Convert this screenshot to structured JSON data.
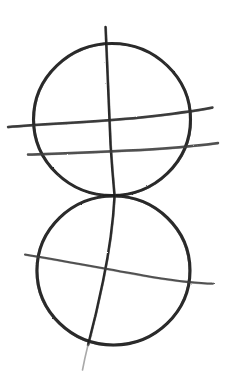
{
  "canvas": {
    "width": 234,
    "height": 383,
    "background_color": "#ffffff",
    "medium": "pencil-sketch",
    "subject": "two tangent circles with meridian and latitude guide lines"
  },
  "palette": {
    "ink": "#1c1c1c",
    "ink_soft": "#3a3a3a",
    "ink_faint": "#8c8c8c",
    "paper": "#ffffff"
  },
  "shapes": [
    {
      "name": "upper-circle",
      "kind": "circle",
      "cx": 112,
      "cy": 119.5,
      "rx": 78.5,
      "ry": 76,
      "stroke_color": "#1c1c1c",
      "stroke_width": 3.1,
      "path": "M 112 43.5 C 155 43.5 190.5 77.5 190.5 119.5 C 190.5 161.5 155 195.5 112 195.5 C 69 195.5 33.5 161.5 33.5 119.5 C 33.5 77.5 69 43.5 112 43.5 Z"
    },
    {
      "name": "lower-circle",
      "kind": "circle",
      "cx": 113.5,
      "cy": 270.5,
      "rx": 76.5,
      "ry": 74.5,
      "stroke_color": "#1c1c1c",
      "stroke_width": 3.1,
      "path": "M 113.5 196 C 155.5 196 190 229.5 190 270.5 C 190 311.5 155.5 345 113.5 345 C 71.5 345 37 311.5 37 270.5 C 37 229.5 71.5 196 113.5 196 Z"
    },
    {
      "name": "meridian-curve-upper",
      "kind": "open-curve",
      "stroke_color": "#1c1c1c",
      "stroke_width": 2.4,
      "path": "M 105.5 27 C 107.5 70 109 110 110.5 145 C 112 168 113.5 185 114.5 196"
    },
    {
      "name": "meridian-curve-lower",
      "kind": "open-curve",
      "stroke_color": "#1c1c1c",
      "stroke_width": 2.4,
      "path": "M 114.5 196 C 113 225 109 252 103 281 C 97.5 308 92 330 88 345"
    },
    {
      "name": "meridian-tail",
      "kind": "open-curve",
      "stroke_color": "#8c8c8c",
      "stroke_width": 1.6,
      "path": "M 88 345 C 86 353 84 362 82.5 370"
    },
    {
      "name": "latitude-curve-upper",
      "kind": "open-curve",
      "stroke_color": "#2a2a2a",
      "stroke_width": 2.4,
      "path": "M 8 127 C 50 123.5 96 122 140 117.5 C 172 114 197 110.5 212.5 107.5"
    },
    {
      "name": "latitude-curve-middle",
      "kind": "open-curve",
      "stroke_color": "#3a3a3a",
      "stroke_width": 2.5,
      "path": "M 28 154.5 C 72 153 120 151.5 163 148.5 C 189 146.5 207 144.5 218 143"
    },
    {
      "name": "latitude-curve-lower",
      "kind": "open-curve",
      "stroke_color": "#3a3a3a",
      "stroke_width": 2.0,
      "path": "M 25 254.5 C 68 261.5 112 270 152 277 C 180 281.5 201 283.5 213 283.5"
    }
  ],
  "annotations": {
    "tangent_point": {
      "x": 114,
      "y": 195
    },
    "upper_circle_label": "upper sphere",
    "lower_circle_label": "lower sphere"
  }
}
